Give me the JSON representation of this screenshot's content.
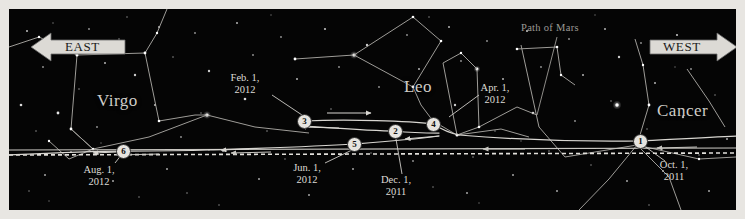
{
  "chart": {
    "title": "Path of Mars",
    "width": 745,
    "height": 219,
    "background_color": "#050505",
    "frame_color": "#e8e6e2"
  },
  "directions": {
    "east": {
      "label": "EAST",
      "points": "left"
    },
    "west": {
      "label": "WEST",
      "points": "right"
    }
  },
  "path_label": {
    "text": "Path of Mars"
  },
  "constellations": [
    {
      "name": "Virgo",
      "x": 95,
      "y": 90
    },
    {
      "name": "Leo",
      "x": 402,
      "y": 75
    },
    {
      "name": "Cancer",
      "x": 655,
      "y": 100
    }
  ],
  "markers": [
    {
      "id": "1",
      "number": "1",
      "x": 631,
      "y": 132
    },
    {
      "id": "2",
      "number": "2",
      "x": 386,
      "y": 122
    },
    {
      "id": "3",
      "number": "3",
      "x": 295,
      "y": 112
    },
    {
      "id": "4",
      "number": "4",
      "x": 424,
      "y": 115
    },
    {
      "id": "5",
      "number": "5",
      "x": 345,
      "y": 135
    },
    {
      "id": "6",
      "number": "6",
      "x": 114,
      "y": 142
    }
  ],
  "date_labels": [
    {
      "id": "oct-2011",
      "line1": "Oct. 1,",
      "line2": "2011",
      "x": 659,
      "y": 157
    },
    {
      "id": "dec-2011",
      "line1": "Dec. 1,",
      "line2": "2011",
      "x": 383,
      "y": 172
    },
    {
      "id": "feb-2012",
      "line1": "Feb. 1,",
      "line2": "2012",
      "x": 229,
      "y": 70
    },
    {
      "id": "apr-2012",
      "line1": "Apr. 1,",
      "line2": "2012",
      "x": 479,
      "y": 80
    },
    {
      "id": "jun-2012",
      "line1": "Jun. 1,",
      "line2": "2012",
      "x": 296,
      "y": 160
    },
    {
      "id": "aug-2012",
      "line1": "Aug. 1,",
      "line2": "2012",
      "x": 88,
      "y": 162
    }
  ],
  "colors": {
    "star": "#ffffff",
    "constellation_line": "#b9b7b2",
    "mars_path": "#d8d6d1",
    "ecliptic": "#c9c7c2",
    "banner_fill": "#dcdad5",
    "banner_stroke": "#6a6a6a"
  }
}
